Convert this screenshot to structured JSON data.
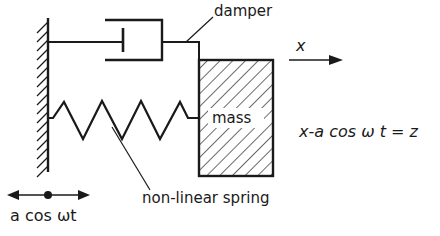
{
  "diagram": {
    "type": "mass-spring-damper schematic",
    "labels": {
      "damper": "damper",
      "mass": "mass",
      "spring": "non-linear spring",
      "displacement": "x",
      "relation": "x-a cos ω t = z",
      "excitation": "a cos ωt"
    },
    "components": [
      {
        "id": "wall",
        "kind": "fixed support (moving base)",
        "hatched": true
      },
      {
        "id": "damper",
        "kind": "dashpot",
        "connects": [
          "wall",
          "mass"
        ]
      },
      {
        "id": "spring",
        "kind": "non-linear spring",
        "connects": [
          "wall",
          "mass"
        ]
      },
      {
        "id": "mass",
        "kind": "rigid mass",
        "hatched": true
      }
    ],
    "arrows": [
      {
        "id": "x-arrow",
        "direction": "right",
        "label": "x"
      },
      {
        "id": "base-excitation-arrow",
        "direction": "both",
        "label": "a cos ωt"
      }
    ],
    "colors": {
      "ink": "#1a1a1a",
      "background": "#ffffff"
    }
  }
}
